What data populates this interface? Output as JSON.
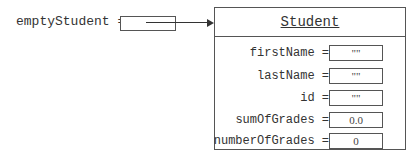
{
  "reference": {
    "variable": "emptyStudent",
    "operator": "="
  },
  "object": {
    "class_name": "Student",
    "fields": [
      {
        "name": "firstName",
        "operator": "=",
        "value": "\"\""
      },
      {
        "name": "lastName",
        "operator": "=",
        "value": "\"\""
      },
      {
        "name": "id",
        "operator": "=",
        "value": "\"\""
      },
      {
        "name": "sumOfGrades",
        "operator": "=",
        "value": "0.0"
      },
      {
        "name": "numberOfGrades",
        "operator": "=",
        "value": "0"
      }
    ]
  }
}
